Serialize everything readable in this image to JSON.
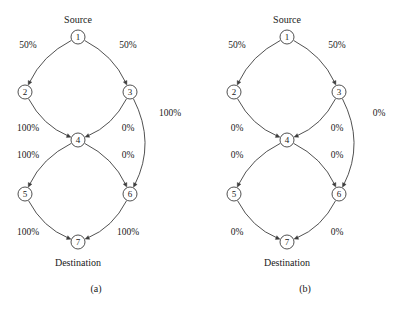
{
  "figure": {
    "background_color": "#ffffff",
    "ink_color": "#3d3d3d",
    "text_color": "#1a1a1a"
  },
  "chart_data": {
    "type": "diagram",
    "title": "",
    "panels": [
      {
        "caption": "(a)",
        "source_label": "Source",
        "destination_label": "Destination",
        "nodes": [
          {
            "id": "1",
            "label": "1",
            "x": 78,
            "y": 37
          },
          {
            "id": "2",
            "label": "2",
            "x": 25,
            "y": 92
          },
          {
            "id": "3",
            "label": "3",
            "x": 130,
            "y": 92
          },
          {
            "id": "4",
            "label": "4",
            "x": 78,
            "y": 140
          },
          {
            "id": "5",
            "label": "5",
            "x": 25,
            "y": 194
          },
          {
            "id": "6",
            "label": "6",
            "x": 130,
            "y": 194
          },
          {
            "id": "7",
            "label": "7",
            "x": 78,
            "y": 242
          }
        ],
        "edges": [
          {
            "from": "1",
            "to": "2",
            "label": "50%",
            "label_x": 28,
            "label_y": 45
          },
          {
            "from": "1",
            "to": "3",
            "label": "50%",
            "label_x": 128,
            "label_y": 45
          },
          {
            "from": "2",
            "to": "4",
            "label": "100%",
            "label_x": 28,
            "label_y": 128
          },
          {
            "from": "3",
            "to": "4",
            "label": "0%",
            "label_x": 128,
            "label_y": 128
          },
          {
            "from": "4",
            "to": "5",
            "label": "100%",
            "label_x": 28,
            "label_y": 155
          },
          {
            "from": "4",
            "to": "6",
            "label": "0%",
            "label_x": 128,
            "label_y": 155
          },
          {
            "from": "5",
            "to": "7",
            "label": "100%",
            "label_x": 28,
            "label_y": 232
          },
          {
            "from": "6",
            "to": "7",
            "label": "100%",
            "label_x": 128,
            "label_y": 232
          },
          {
            "from": "3",
            "to": "6",
            "label": "100%",
            "label_x": 170,
            "label_y": 113
          }
        ]
      },
      {
        "caption": "(b)",
        "source_label": "Source",
        "destination_label": "Destination",
        "nodes": [
          {
            "id": "1",
            "label": "1",
            "x": 78,
            "y": 37
          },
          {
            "id": "2",
            "label": "2",
            "x": 25,
            "y": 92
          },
          {
            "id": "3",
            "label": "3",
            "x": 130,
            "y": 92
          },
          {
            "id": "4",
            "label": "4",
            "x": 78,
            "y": 140
          },
          {
            "id": "5",
            "label": "5",
            "x": 25,
            "y": 194
          },
          {
            "id": "6",
            "label": "6",
            "x": 130,
            "y": 194
          },
          {
            "id": "7",
            "label": "7",
            "x": 78,
            "y": 242
          }
        ],
        "edges": [
          {
            "from": "1",
            "to": "2",
            "label": "50%",
            "label_x": 28,
            "label_y": 45
          },
          {
            "from": "1",
            "to": "3",
            "label": "50%",
            "label_x": 128,
            "label_y": 45
          },
          {
            "from": "2",
            "to": "4",
            "label": "0%",
            "label_x": 28,
            "label_y": 128
          },
          {
            "from": "3",
            "to": "4",
            "label": "0%",
            "label_x": 128,
            "label_y": 128
          },
          {
            "from": "4",
            "to": "5",
            "label": "0%",
            "label_x": 28,
            "label_y": 155
          },
          {
            "from": "4",
            "to": "6",
            "label": "0%",
            "label_x": 128,
            "label_y": 155
          },
          {
            "from": "5",
            "to": "7",
            "label": "0%",
            "label_x": 28,
            "label_y": 232
          },
          {
            "from": "6",
            "to": "7",
            "label": "0%",
            "label_x": 128,
            "label_y": 232
          },
          {
            "from": "3",
            "to": "6",
            "label": "0%",
            "label_x": 170,
            "label_y": 113
          }
        ]
      }
    ],
    "source_position": {
      "x": 78,
      "y": 19
    },
    "destination_position": {
      "x": 78,
      "y": 262
    },
    "caption_position": {
      "x": 96,
      "y": 288
    },
    "node_radius": 7
  }
}
